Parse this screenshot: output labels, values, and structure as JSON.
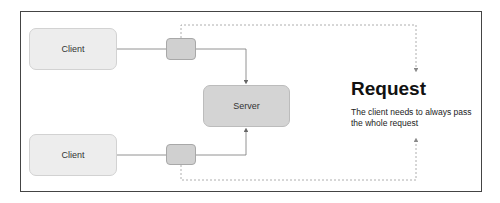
{
  "diagram": {
    "nodes": {
      "client_top": {
        "label": "Client"
      },
      "client_bottom": {
        "label": "Client"
      },
      "server": {
        "label": "Server"
      }
    },
    "annotation": {
      "title": "Request",
      "description": "The client needs to always pass the whole request"
    },
    "colors": {
      "frame": "#444444",
      "client_fill": "#ededed",
      "server_fill": "#d4d4d4",
      "connector_fill": "#d0d0d0",
      "edge": "#777777",
      "dashed_edge": "#999999"
    }
  }
}
